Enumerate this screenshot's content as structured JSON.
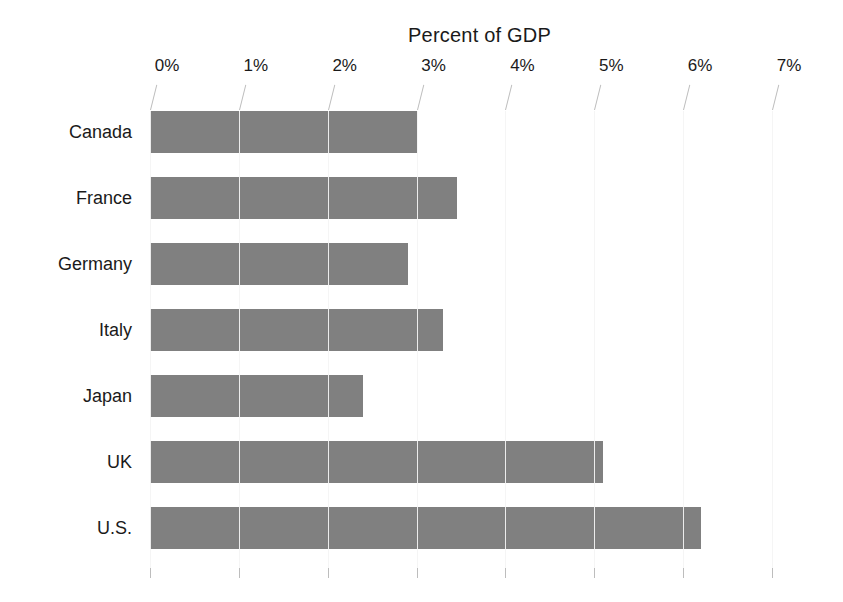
{
  "chart_data": {
    "type": "bar",
    "orientation": "horizontal",
    "title": "Percent of GDP",
    "xlabel": "",
    "ylabel": "",
    "categories": [
      "Canada",
      "France",
      "Germany",
      "Italy",
      "Japan",
      "UK",
      "U.S."
    ],
    "values": [
      3.0,
      3.45,
      2.9,
      3.3,
      2.4,
      5.1,
      6.2
    ],
    "xlim": [
      0,
      7
    ],
    "xtick_values": [
      0,
      1,
      2,
      3,
      4,
      5,
      6,
      7
    ],
    "xtick_labels": [
      "0%",
      "1%",
      "2%",
      "3%",
      "4%",
      "5%",
      "6%",
      "7%"
    ],
    "grid": true,
    "grid_axis": "x",
    "legend": false,
    "bar_color": "#808080",
    "grid_color": "#bdbdbd",
    "background_color": "#ffffff",
    "text_color": "#1a1a1a"
  }
}
